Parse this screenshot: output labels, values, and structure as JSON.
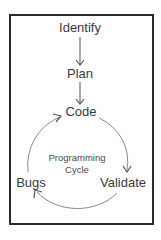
{
  "diagram": {
    "type": "flow-with-cycle",
    "nodes": {
      "identify": "Identify",
      "plan": "Plan",
      "code": "Code",
      "validate": "Validate",
      "bugs": "Bugs"
    },
    "cycle_label": {
      "line1": "Programming",
      "line2": "Cycle"
    },
    "edges": [
      {
        "from": "Identify",
        "to": "Plan"
      },
      {
        "from": "Plan",
        "to": "Code"
      },
      {
        "from": "Code",
        "to": "Validate"
      },
      {
        "from": "Validate",
        "to": "Bugs"
      },
      {
        "from": "Bugs",
        "to": "Code"
      }
    ],
    "colors": {
      "frame": "#2b2b2b",
      "text": "#3a3a3a",
      "arrow": "#555555",
      "cycle_arc": "#8a8a8a"
    }
  }
}
